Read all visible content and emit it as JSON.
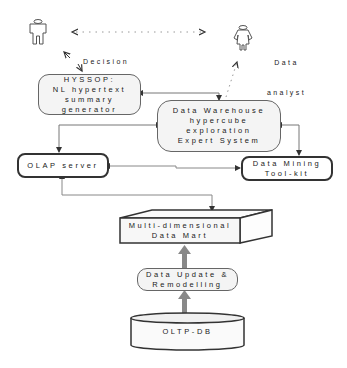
{
  "diagram": {
    "actors": {
      "decision_maker": {
        "label_line1": "Decision",
        "label_line2": "maker",
        "icon": "person-icon"
      },
      "data_analyst": {
        "label_line1": "Data",
        "label_line2": "analyst",
        "icon": "person-icon"
      }
    },
    "nodes": {
      "hyssop": {
        "lines": [
          "HYSSOP:",
          "NL hypertext",
          "summary",
          "generator"
        ]
      },
      "data_warehouse": {
        "lines": [
          "Data Warehouse",
          "hypercube",
          "exploration",
          "Expert System"
        ]
      },
      "olap": {
        "lines": [
          "OLAP server"
        ]
      },
      "data_mining": {
        "lines": [
          "Data Mining",
          "Tool-kit"
        ]
      },
      "data_mart": {
        "lines": [
          "Multi-dimensional",
          "Data Mart"
        ]
      },
      "data_update": {
        "lines": [
          "Data Update &",
          "Remodelling"
        ]
      },
      "oltp_db": {
        "lines": [
          "OLTP-DB"
        ]
      }
    },
    "edges": [
      {
        "from": "decision_maker",
        "to": "data_analyst",
        "style": "dotted",
        "arrows": "both"
      },
      {
        "from": "decision_maker",
        "to": "hyssop",
        "style": "dotted",
        "arrows": "both"
      },
      {
        "from": "data_analyst",
        "to": "data_warehouse",
        "style": "dotted",
        "arrows": "both"
      },
      {
        "from": "hyssop",
        "to": "data_warehouse",
        "style": "solid",
        "arrows": "both"
      },
      {
        "from": "data_warehouse",
        "to": "olap",
        "style": "solid",
        "arrows": "both"
      },
      {
        "from": "data_warehouse",
        "to": "data_mining",
        "style": "solid",
        "arrows": "both"
      },
      {
        "from": "olap",
        "to": "data_mining",
        "style": "solid",
        "arrows": "both"
      },
      {
        "from": "olap",
        "to": "data_mart",
        "style": "solid",
        "arrows": "both"
      },
      {
        "from": "data_update",
        "to": "data_mart",
        "style": "thick",
        "arrows": "forward"
      },
      {
        "from": "oltp_db",
        "to": "data_update",
        "style": "thick",
        "arrows": "forward"
      }
    ],
    "colors": {
      "line": "#777777",
      "thick_arrow": "#888888",
      "box_fill": "#f4f4f4",
      "border_dark": "#333333"
    }
  }
}
